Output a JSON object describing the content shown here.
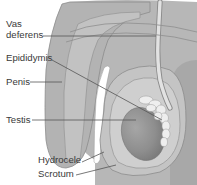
{
  "diagram": {
    "type": "anatomical-illustration",
    "labels": [
      {
        "id": "vas-deferens",
        "lines": [
          "Vas",
          "deferens"
        ]
      },
      {
        "id": "epididymis",
        "text": "Epididymis"
      },
      {
        "id": "penis",
        "text": "Penis"
      },
      {
        "id": "testis",
        "text": "Testis"
      },
      {
        "id": "hydrocele",
        "text": "Hydrocele"
      },
      {
        "id": "scrotum",
        "text": "Scrotum"
      }
    ],
    "colors": {
      "background": "#ffffff",
      "body": "#b9b9b9",
      "body_dark": "#a9a9a9",
      "scrotum_fill": "#c4c4c4",
      "hydrocele_fluid": "#cfcfcf",
      "testis": "#8f8f8f",
      "epididymis": "#ececec",
      "vas_deferens": "#dcdcdc",
      "urethra": "#ffffff",
      "outline": "#8a8a8a",
      "leader_line": "#555555",
      "label_text": "#3a3a3a"
    }
  }
}
